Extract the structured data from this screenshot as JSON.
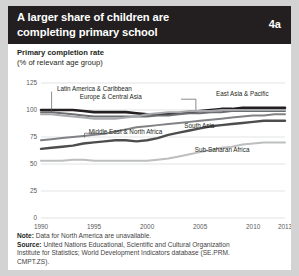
{
  "header": {
    "title": "A larger share of children are completing primary school",
    "badge": "4a",
    "bg_color": "#231f20"
  },
  "subtitle": {
    "line1": "Primary completion rate",
    "line2": "(% of relevant age group)"
  },
  "footer": {
    "note_label": "Note:",
    "note_text": " Data for North America are unavailable.",
    "source_label": "Source:",
    "source_line1": " United Nations Educational, Scientific and Cultural Organization",
    "source_line2": "Institute for Statistics; World Development Indicators database (SE.PRM.",
    "source_line3": "CMPT.ZS)."
  },
  "chart_data": {
    "type": "line",
    "title": "Primary completion rate",
    "subtitle": "(% of relevant age group)",
    "xlabel": "",
    "ylabel": "% of relevant age group",
    "xlim": [
      1990,
      2013
    ],
    "ylim": [
      0,
      125
    ],
    "yticks": [
      0,
      25,
      50,
      75,
      100,
      125
    ],
    "xticks": [
      1990,
      1995,
      2000,
      2005,
      2010,
      2013
    ],
    "grid": true,
    "legend": "inline-labels",
    "x": [
      1990,
      1991,
      1992,
      1993,
      1994,
      1995,
      1996,
      1997,
      1998,
      1999,
      2000,
      2001,
      2002,
      2003,
      2004,
      2005,
      2006,
      2007,
      2008,
      2009,
      2010,
      2011,
      2012,
      2013
    ],
    "series": [
      {
        "name": "East Asia & Pacific",
        "color": "#231f20",
        "width": 2.6,
        "values": [
          100,
          100,
          100,
          100,
          99,
          98,
          98,
          98,
          98,
          97,
          96,
          96,
          96,
          97,
          98,
          99,
          100,
          101,
          101,
          102,
          102,
          102,
          102,
          102
        ]
      },
      {
        "name": "Europe & Central Asia",
        "color": "#6d6e71",
        "width": 2.0,
        "values": [
          98,
          98,
          97,
          96,
          95,
          94,
          94,
          94,
          94,
          94,
          94,
          95,
          95,
          96,
          97,
          97,
          98,
          98,
          99,
          99,
          99,
          99,
          99,
          99
        ]
      },
      {
        "name": "Latin America & Caribbean",
        "color": "#a7a9ac",
        "width": 2.0,
        "values": [
          96,
          96,
          95,
          94,
          93,
          92,
          92,
          92,
          93,
          94,
          96,
          97,
          98,
          98,
          99,
          99,
          99,
          100,
          100,
          100,
          100,
          100,
          100,
          100
        ]
      },
      {
        "name": "Middle East & North Africa",
        "color": "#808285",
        "width": 2.0,
        "values": [
          72,
          73,
          74,
          75,
          76,
          77,
          78,
          80,
          82,
          84,
          85,
          86,
          87,
          88,
          89,
          90,
          91,
          92,
          93,
          94,
          95,
          95,
          96,
          96
        ]
      },
      {
        "name": "South Asia",
        "color": "#4d4d4f",
        "width": 2.4,
        "values": [
          64,
          65,
          66,
          67,
          69,
          70,
          71,
          72,
          72,
          71,
          72,
          74,
          77,
          79,
          81,
          83,
          85,
          86,
          87,
          88,
          89,
          90,
          90,
          90
        ]
      },
      {
        "name": "Sub-Saharan Africa",
        "color": "#bcbec0",
        "width": 2.0,
        "values": [
          53,
          53,
          53,
          54,
          54,
          53,
          53,
          53,
          53,
          53,
          53,
          54,
          55,
          57,
          59,
          61,
          63,
          65,
          66,
          68,
          69,
          70,
          70,
          70
        ]
      }
    ],
    "annotations": [
      {
        "text": "Latin America & Caribbean",
        "x": 1991.5,
        "y": 118
      },
      {
        "text": "Europe & Central Asia",
        "x": 1999.5,
        "y": 110
      },
      {
        "text": "East Asia & Pacific",
        "x": 2006.5,
        "y": 113
      },
      {
        "text": "Middle East & North Africa",
        "x": 1994.5,
        "y": 78
      },
      {
        "text": "South Asia",
        "x": 2003.5,
        "y": 83
      },
      {
        "text": "Sub-Saharan Africa",
        "x": 2004.5,
        "y": 61
      }
    ]
  }
}
